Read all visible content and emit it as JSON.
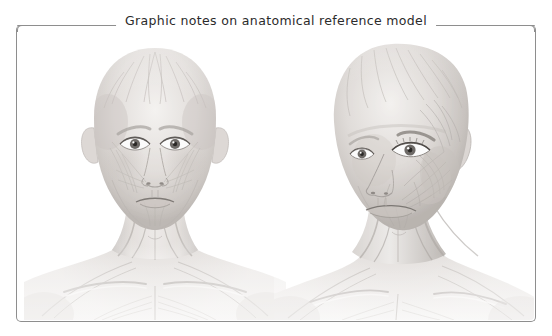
{
  "panel": {
    "title": "Graphic notes on anatomical reference model",
    "border_color": "#8e8e8e",
    "background_color": "#ffffff",
    "title_color": "#2b2b2b"
  },
  "figures": [
    {
      "name": "anatomical-figure-frontal",
      "view": "frontal",
      "subject": "female head, neck and upper chest with superficial facial musculature",
      "style": "grayscale pencil / ecorche rendering",
      "alt": "Frontal view anatomical reference model showing facial muscles, sternocleidomastoid, clavicles and pectoral region"
    },
    {
      "name": "anatomical-figure-three-quarter",
      "view": "three-quarter",
      "subject": "female head, neck and shoulder with superficial facial musculature",
      "style": "grayscale pencil / ecorche rendering",
      "alt": "Three-quarter view anatomical reference model showing temporalis, masseter, orbicularis oris and neck musculature"
    }
  ],
  "palette": {
    "skin_light": "#f3f1ef",
    "skin_mid": "#d8d4d1",
    "skin_shadow": "#b4afab",
    "muscle_line": "#a49f9b",
    "deep_shadow": "#918c88",
    "eye_white": "#fbfbfb",
    "iris": "#6e6a67",
    "pupil": "#2a2826"
  }
}
